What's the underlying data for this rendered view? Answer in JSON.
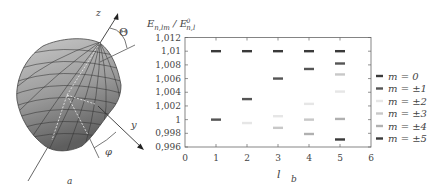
{
  "panel_a": {
    "label": "a",
    "axis_z_label": "z",
    "axis_y_label": "y",
    "angle_theta_label": "Θ",
    "angle_phi_label": "φ"
  },
  "panel_b": {
    "label": "b",
    "ylabel_main": "E",
    "ylabel_main_sub": "n,lm",
    "ylabel_ref": "E",
    "ylabel_ref_sup": "0",
    "ylabel_ref_sub": "n,l",
    "xlabel": "l"
  },
  "legend": {
    "items": [
      {
        "label": "m = 0",
        "color": "#3a3a3a"
      },
      {
        "label": "m = ±1",
        "color": "#555555"
      },
      {
        "label": "m = ±2",
        "color": "#e6e6e6"
      },
      {
        "label": "m = ±3",
        "color": "#c8c8c8"
      },
      {
        "label": "m = ±4",
        "color": "#b0b0b0"
      },
      {
        "label": "m = ±5",
        "color": "#3a3a3a"
      }
    ]
  },
  "chart_data": {
    "type": "scatter",
    "title": "",
    "xlabel": "l",
    "ylabel": "E_{n,lm} / E^0_{n,l}",
    "xlim": [
      0,
      6
    ],
    "ylim": [
      0.996,
      1.012
    ],
    "x_ticks": [
      "0",
      "1",
      "2",
      "3",
      "4",
      "5",
      "6"
    ],
    "y_ticks": [
      "0,996",
      "0,998",
      "1",
      "1,002",
      "1,004",
      "1,006",
      "1,008",
      "1,01",
      "1,012"
    ],
    "grid": false,
    "legend_position": "right, outside",
    "marker": "short horizontal dash",
    "series": [
      {
        "name": "m = 0",
        "color": "#3a3a3a",
        "points": [
          [
            1,
            1.01
          ],
          [
            2,
            1.01
          ],
          [
            3,
            1.01
          ],
          [
            4,
            1.01
          ],
          [
            5,
            1.01
          ]
        ]
      },
      {
        "name": "m = ±1",
        "color": "#555555",
        "points": [
          [
            1,
            1.0
          ],
          [
            2,
            1.003
          ],
          [
            3,
            1.006
          ],
          [
            4,
            1.0074
          ],
          [
            5,
            1.0082
          ]
        ]
      },
      {
        "name": "m = ±2",
        "color": "#e6e6e6",
        "points": [
          [
            2,
            0.9995
          ],
          [
            3,
            1.0005
          ],
          [
            4,
            1.0023
          ],
          [
            5,
            1.0041
          ]
        ]
      },
      {
        "name": "m = ±3",
        "color": "#c8c8c8",
        "points": [
          [
            3,
            0.9988
          ],
          [
            4,
            1.0
          ],
          [
            5,
            1.0066
          ]
        ]
      },
      {
        "name": "m = ±4",
        "color": "#b0b0b0",
        "points": [
          [
            4,
            0.9979
          ],
          [
            5,
            1.0001
          ]
        ]
      },
      {
        "name": "m = ±5",
        "color": "#3a3a3a",
        "points": [
          [
            5,
            0.9971
          ]
        ]
      }
    ]
  }
}
